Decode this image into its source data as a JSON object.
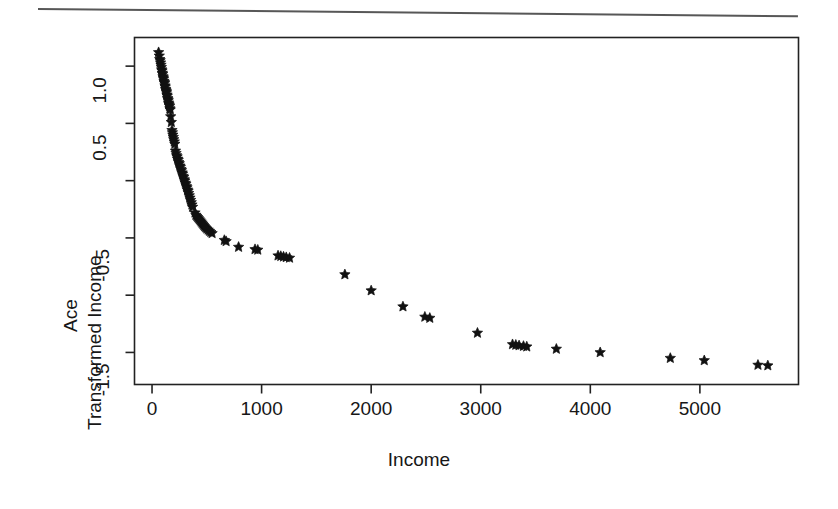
{
  "page": {
    "background_color": "#ffffff",
    "ink_color": "#1a1a1a",
    "rule_label": "page-top-rule"
  },
  "axis_titles": {
    "x": "Income",
    "y_line1": "Ace",
    "y_line2": "Transformed Income"
  },
  "x_ticks": [
    {
      "value": 0,
      "label": "0"
    },
    {
      "value": 1000,
      "label": "1000"
    },
    {
      "value": 2000,
      "label": "2000"
    },
    {
      "value": 3000,
      "label": "3000"
    },
    {
      "value": 4000,
      "label": "4000"
    },
    {
      "value": 5000,
      "label": "5000"
    }
  ],
  "y_ticks": [
    {
      "value": 1.0,
      "label": "1.0"
    },
    {
      "value": 0.5,
      "label": "0.5"
    },
    {
      "value": 0.0,
      "label": ""
    },
    {
      "value": -0.5,
      "label": "-0.5"
    },
    {
      "value": -1.0,
      "label": ""
    },
    {
      "value": -1.5,
      "label": "-1.5"
    }
  ],
  "chart_data": {
    "type": "scatter",
    "title": "",
    "subtitle": "",
    "xlabel": "Income",
    "ylabel": "Ace Transformed Income",
    "marker": "star",
    "marker_color": "#111111",
    "marker_size": 7,
    "grid": false,
    "legend": null,
    "xlim": [
      -160,
      5900
    ],
    "ylim": [
      -1.78,
      1.25
    ],
    "x_tick_values": [
      0,
      1000,
      2000,
      3000,
      4000,
      5000
    ],
    "y_tick_values": [
      1.0,
      0.5,
      0.0,
      -0.5,
      -1.0,
      -1.5
    ],
    "y_minor_unlabeled": [
      0.0,
      -1.0
    ],
    "annotations": [],
    "points": [
      [
        60,
        1.12
      ],
      [
        66,
        1.09
      ],
      [
        70,
        1.06
      ],
      [
        74,
        1.05
      ],
      [
        78,
        1.03
      ],
      [
        82,
        1.01
      ],
      [
        85,
        0.99
      ],
      [
        88,
        0.97
      ],
      [
        91,
        0.96
      ],
      [
        94,
        0.94
      ],
      [
        97,
        0.93
      ],
      [
        100,
        0.91
      ],
      [
        103,
        0.9
      ],
      [
        106,
        0.89
      ],
      [
        109,
        0.87
      ],
      [
        112,
        0.86
      ],
      [
        115,
        0.85
      ],
      [
        118,
        0.83
      ],
      [
        121,
        0.82
      ],
      [
        124,
        0.8
      ],
      [
        127,
        0.79
      ],
      [
        130,
        0.78
      ],
      [
        133,
        0.77
      ],
      [
        136,
        0.75
      ],
      [
        139,
        0.74
      ],
      [
        142,
        0.72
      ],
      [
        145,
        0.71
      ],
      [
        148,
        0.7
      ],
      [
        151,
        0.68
      ],
      [
        154,
        0.67
      ],
      [
        157,
        0.66
      ],
      [
        160,
        0.65
      ],
      [
        163,
        0.63
      ],
      [
        166,
        0.62
      ],
      [
        170,
        0.56
      ],
      [
        176,
        0.51
      ],
      [
        182,
        0.44
      ],
      [
        186,
        0.42
      ],
      [
        190,
        0.4
      ],
      [
        194,
        0.38
      ],
      [
        198,
        0.36
      ],
      [
        203,
        0.34
      ],
      [
        208,
        0.32
      ],
      [
        214,
        0.26
      ],
      [
        219,
        0.24
      ],
      [
        224,
        0.22
      ],
      [
        229,
        0.21
      ],
      [
        234,
        0.19
      ],
      [
        239,
        0.18
      ],
      [
        244,
        0.16
      ],
      [
        249,
        0.15
      ],
      [
        254,
        0.13
      ],
      [
        259,
        0.12
      ],
      [
        264,
        0.1
      ],
      [
        269,
        0.09
      ],
      [
        274,
        0.07
      ],
      [
        279,
        0.06
      ],
      [
        284,
        0.04
      ],
      [
        289,
        0.03
      ],
      [
        294,
        0.01
      ],
      [
        299,
        0.0
      ],
      [
        304,
        -0.02
      ],
      [
        309,
        -0.03
      ],
      [
        314,
        -0.05
      ],
      [
        319,
        -0.06
      ],
      [
        324,
        -0.08
      ],
      [
        329,
        -0.09
      ],
      [
        334,
        -0.11
      ],
      [
        340,
        -0.13
      ],
      [
        346,
        -0.15
      ],
      [
        352,
        -0.17
      ],
      [
        358,
        -0.19
      ],
      [
        364,
        -0.21
      ],
      [
        370,
        -0.23
      ],
      [
        392,
        -0.28
      ],
      [
        400,
        -0.3
      ],
      [
        408,
        -0.31
      ],
      [
        416,
        -0.32
      ],
      [
        424,
        -0.33
      ],
      [
        432,
        -0.34
      ],
      [
        440,
        -0.35
      ],
      [
        448,
        -0.36
      ],
      [
        456,
        -0.37
      ],
      [
        464,
        -0.38
      ],
      [
        472,
        -0.39
      ],
      [
        480,
        -0.4
      ],
      [
        490,
        -0.41
      ],
      [
        500,
        -0.42
      ],
      [
        512,
        -0.43
      ],
      [
        524,
        -0.44
      ],
      [
        536,
        -0.45
      ],
      [
        548,
        -0.46
      ],
      [
        660,
        -0.52
      ],
      [
        676,
        -0.53
      ],
      [
        790,
        -0.58
      ],
      [
        940,
        -0.6
      ],
      [
        965,
        -0.605
      ],
      [
        1150,
        -0.655
      ],
      [
        1175,
        -0.66
      ],
      [
        1200,
        -0.665
      ],
      [
        1225,
        -0.67
      ],
      [
        1255,
        -0.675
      ],
      [
        1760,
        -0.82
      ],
      [
        2000,
        -0.96
      ],
      [
        2290,
        -1.1
      ],
      [
        2490,
        -1.19
      ],
      [
        2535,
        -1.2
      ],
      [
        2970,
        -1.33
      ],
      [
        3290,
        -1.43
      ],
      [
        3320,
        -1.435
      ],
      [
        3350,
        -1.44
      ],
      [
        3390,
        -1.445
      ],
      [
        3420,
        -1.45
      ],
      [
        3690,
        -1.47
      ],
      [
        4090,
        -1.5
      ],
      [
        4730,
        -1.55
      ],
      [
        5040,
        -1.57
      ],
      [
        5530,
        -1.61
      ],
      [
        5620,
        -1.615
      ]
    ]
  }
}
